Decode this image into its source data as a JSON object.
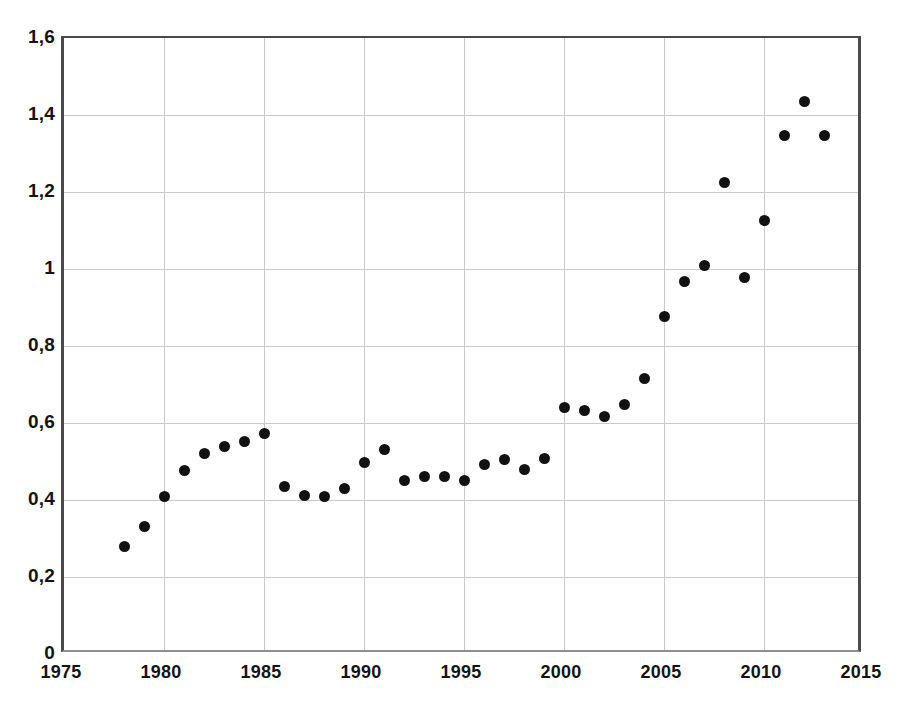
{
  "chart_data": {
    "type": "scatter",
    "title": "",
    "xlabel": "",
    "ylabel": "",
    "xlim": [
      1975,
      2015
    ],
    "ylim": [
      0,
      1.6
    ],
    "grid": true,
    "legend": null,
    "decimal_separator": ",",
    "marker": {
      "shape": "circle",
      "color": "#111111",
      "size_px": 11
    },
    "xticks": [
      "1975",
      "1980",
      "1985",
      "1990",
      "1995",
      "2000",
      "2005",
      "2010",
      "2015"
    ],
    "xtick_values": [
      1975,
      1980,
      1985,
      1990,
      1995,
      2000,
      2005,
      2010,
      2015
    ],
    "yticks": [
      "0",
      "0,2",
      "0,4",
      "0,6",
      "0,8",
      "1",
      "1,2",
      "1,4",
      "1,6"
    ],
    "ytick_values": [
      0,
      0.2,
      0.4,
      0.6,
      0.8,
      1.0,
      1.2,
      1.4,
      1.6
    ],
    "x": [
      1978,
      1979,
      1980,
      1981,
      1982,
      1983,
      1984,
      1985,
      1986,
      1987,
      1988,
      1989,
      1990,
      1991,
      1992,
      1993,
      1994,
      1995,
      1996,
      1997,
      1998,
      1999,
      2000,
      2001,
      2002,
      2003,
      2004,
      2005,
      2006,
      2007,
      2008,
      2009,
      2010,
      2011,
      2012,
      2013
    ],
    "values": [
      0.28,
      0.33,
      0.41,
      0.478,
      0.522,
      0.538,
      0.551,
      0.572,
      0.435,
      0.412,
      0.41,
      0.43,
      0.498,
      0.532,
      0.452,
      0.462,
      0.46,
      0.45,
      0.492,
      0.505,
      0.479,
      0.509,
      0.64,
      0.632,
      0.617,
      0.647,
      0.715,
      0.878,
      0.967,
      1.008,
      1.225,
      0.978,
      1.125,
      1.347,
      1.436,
      1.347
    ]
  },
  "accent_colors": {
    "marker": "#111111",
    "axis": "#4a4a4a",
    "grid": "#c9c9c9",
    "background": "#ffffff"
  }
}
